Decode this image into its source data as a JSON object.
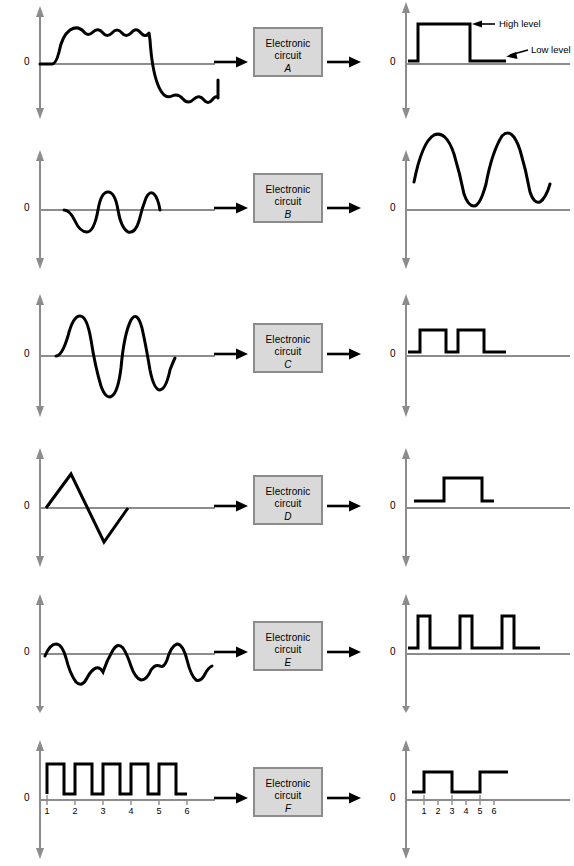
{
  "figure": {
    "zero_label": "0",
    "box_line1": "Electronic",
    "box_line2": "circuit",
    "flow_arrow": "right-arrow"
  },
  "annotations": {
    "high_level": "High level",
    "low_level": "Low level"
  },
  "colors": {
    "axis": "#8c8c8c",
    "signal": "#000000",
    "box_fill": "#d9d9d9",
    "box_border": "#8c8c8c",
    "background": "#ffffff"
  },
  "tick_labels": [
    "1",
    "2",
    "3",
    "4",
    "5",
    "6"
  ],
  "rows": [
    {
      "id": "A",
      "box_id": "A",
      "input_name": "noisy-square-wave",
      "output_name": "clean-square-pulse",
      "input_description": "Rippled square wave swinging above and below zero",
      "output_description": "Clean rectangular pulse between low level and high level",
      "has_annotations": true,
      "has_ticks": false
    },
    {
      "id": "B",
      "box_id": "B",
      "input_name": "small-sine-wave",
      "output_name": "large-offset-sine-wave",
      "input_description": "Two small sine cycles centered on zero",
      "output_description": "Two large amplified sine cycles offset above zero",
      "has_annotations": false,
      "has_ticks": false
    },
    {
      "id": "C",
      "box_id": "C",
      "input_name": "sine-wave",
      "output_name": "two-square-pulses",
      "input_description": "Two sine cycles centered on zero",
      "output_description": "Two rectangular pulses above zero",
      "has_annotations": false,
      "has_ticks": false
    },
    {
      "id": "D",
      "box_id": "D",
      "input_name": "triangle-wave",
      "output_name": "single-square-pulse",
      "input_description": "One triangular cycle, positive peak then negative peak",
      "output_description": "One rectangular pulse above zero",
      "has_annotations": false,
      "has_ticks": false
    },
    {
      "id": "E",
      "box_id": "E",
      "input_name": "irregular-wave",
      "output_name": "three-narrow-pulses",
      "input_description": "Irregular noisy waveform with three positive peaks",
      "output_description": "Three narrow rectangular pulses above zero",
      "has_annotations": false,
      "has_ticks": false
    },
    {
      "id": "F",
      "box_id": "F",
      "input_name": "six-pulse-train",
      "output_name": "divided-pulse-train",
      "input_description": "Pulse train of six pulses numbered 1 through 6",
      "output_description": "Half frequency pulse train toggling at counts 1, 3 and 5",
      "has_annotations": false,
      "has_ticks": true
    }
  ]
}
